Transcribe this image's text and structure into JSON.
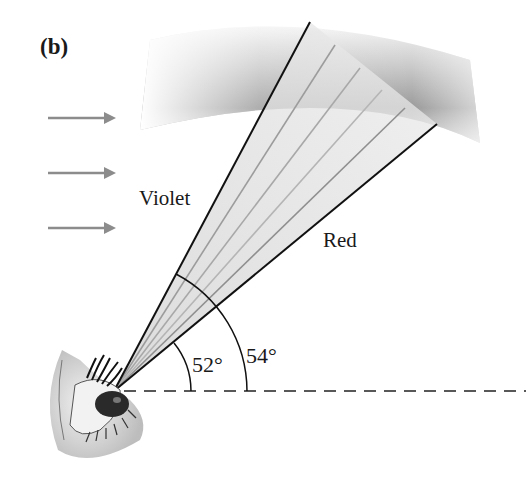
{
  "figure": {
    "panel_label": "(b)",
    "labels": {
      "violet": "Violet",
      "red": "Red",
      "angle_violet": "52°",
      "angle_red": "54°"
    },
    "incoming_light_arrows": 3,
    "colored_rays_count": 6,
    "elements": [
      "rainbow-arc-band",
      "sunlight-arrows",
      "ray-fan",
      "observer-eye",
      "horizontal-dashed-reference",
      "angle-arcs"
    ],
    "colors": {
      "line": "#111111",
      "arrow": "#8c8c8c",
      "band_dark": "#8a8a8a",
      "band_light": "#f0f0f0",
      "ray_fill": "#dcdcdc",
      "background": "#ffffff"
    }
  }
}
